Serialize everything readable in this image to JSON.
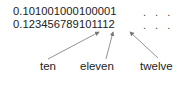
{
  "lines": {
    "line1": "0.101001000100001",
    "line2": "0.123456789101112",
    "ellipsis1": ". . .",
    "ellipsis2": ". . ."
  },
  "labels": {
    "ten": "ten",
    "eleven": "eleven",
    "twelve": "twelve"
  },
  "colors": {
    "text": "#222222",
    "arrow": "#777777"
  }
}
